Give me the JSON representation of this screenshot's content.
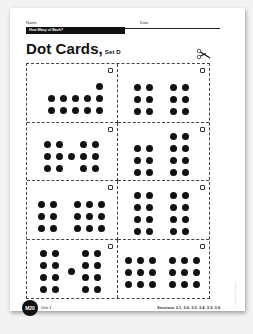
{
  "header": {
    "name_label": "Name",
    "date_label": "Date",
    "banner": "How Many of Each?"
  },
  "title": {
    "main": "Dot Cards,",
    "set": "Set D"
  },
  "cards": [
    {
      "count": 11,
      "dots": [
        [
          24,
          34
        ],
        [
          36,
          34
        ],
        [
          48,
          34
        ],
        [
          60,
          34
        ],
        [
          72,
          34
        ],
        [
          24,
          46
        ],
        [
          36,
          46
        ],
        [
          48,
          46
        ],
        [
          60,
          46
        ],
        [
          72,
          46
        ],
        [
          72,
          22
        ]
      ]
    },
    {
      "count": 12,
      "dots": [
        [
          19,
          23
        ],
        [
          31,
          23
        ],
        [
          19,
          35
        ],
        [
          31,
          35
        ],
        [
          19,
          47
        ],
        [
          31,
          47
        ],
        [
          55,
          23
        ],
        [
          67,
          23
        ],
        [
          55,
          35
        ],
        [
          67,
          35
        ],
        [
          55,
          47
        ],
        [
          67,
          47
        ]
      ]
    },
    {
      "count": 13,
      "dots": [
        [
          20,
          22
        ],
        [
          32,
          22
        ],
        [
          20,
          34
        ],
        [
          32,
          34
        ],
        [
          20,
          46
        ],
        [
          32,
          46
        ],
        [
          44,
          34
        ],
        [
          56,
          22
        ],
        [
          68,
          22
        ],
        [
          56,
          34
        ],
        [
          68,
          34
        ],
        [
          56,
          46
        ],
        [
          68,
          46
        ]
      ]
    },
    {
      "count": 14,
      "dots": [
        [
          19,
          26
        ],
        [
          31,
          26
        ],
        [
          19,
          38
        ],
        [
          31,
          38
        ],
        [
          19,
          50
        ],
        [
          31,
          50
        ],
        [
          55,
          14
        ],
        [
          67,
          14
        ],
        [
          55,
          26
        ],
        [
          67,
          26
        ],
        [
          55,
          38
        ],
        [
          67,
          38
        ],
        [
          55,
          50
        ],
        [
          67,
          50
        ]
      ]
    },
    {
      "count": 15,
      "dots": [
        [
          14,
          23
        ],
        [
          26,
          23
        ],
        [
          14,
          35
        ],
        [
          26,
          35
        ],
        [
          14,
          47
        ],
        [
          26,
          47
        ],
        [
          50,
          23
        ],
        [
          62,
          23
        ],
        [
          74,
          23
        ],
        [
          50,
          35
        ],
        [
          62,
          35
        ],
        [
          74,
          35
        ],
        [
          50,
          47
        ],
        [
          62,
          47
        ],
        [
          74,
          47
        ]
      ]
    },
    {
      "count": 16,
      "dots": [
        [
          19,
          14
        ],
        [
          31,
          14
        ],
        [
          19,
          26
        ],
        [
          31,
          26
        ],
        [
          19,
          38
        ],
        [
          31,
          38
        ],
        [
          19,
          50
        ],
        [
          31,
          50
        ],
        [
          55,
          14
        ],
        [
          67,
          14
        ],
        [
          55,
          26
        ],
        [
          67,
          26
        ],
        [
          55,
          38
        ],
        [
          67,
          38
        ],
        [
          55,
          50
        ],
        [
          67,
          50
        ]
      ]
    },
    {
      "count": 17,
      "dots": [
        [
          16,
          14
        ],
        [
          28,
          14
        ],
        [
          16,
          26
        ],
        [
          28,
          26
        ],
        [
          16,
          38
        ],
        [
          28,
          38
        ],
        [
          16,
          50
        ],
        [
          28,
          50
        ],
        [
          44,
          32
        ],
        [
          58,
          14
        ],
        [
          70,
          14
        ],
        [
          58,
          26
        ],
        [
          70,
          26
        ],
        [
          58,
          38
        ],
        [
          70,
          38
        ],
        [
          58,
          50
        ],
        [
          70,
          50
        ]
      ]
    },
    {
      "count": 18,
      "dots": [
        [
          10,
          21
        ],
        [
          22,
          21
        ],
        [
          34,
          21
        ],
        [
          10,
          33
        ],
        [
          22,
          33
        ],
        [
          34,
          33
        ],
        [
          10,
          45
        ],
        [
          22,
          45
        ],
        [
          34,
          45
        ],
        [
          54,
          21
        ],
        [
          66,
          21
        ],
        [
          78,
          21
        ],
        [
          54,
          33
        ],
        [
          66,
          33
        ],
        [
          78,
          33
        ],
        [
          54,
          45
        ],
        [
          66,
          45
        ],
        [
          78,
          45
        ]
      ]
    }
  ],
  "copyright": "© Pearson Education 2",
  "footer": {
    "page_badge": "M20",
    "unit": "Unit 1",
    "sessions": "Sessions 2.1, 2.6, 3.2, 3.4, 3.5, 3.6"
  }
}
